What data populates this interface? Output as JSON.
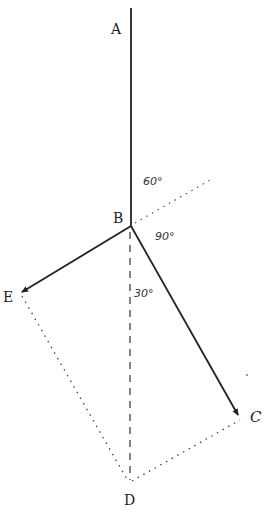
{
  "diagram": {
    "type": "force-vector-parallelogram",
    "points": {
      "A": {
        "label": "A",
        "x": 131,
        "y": 8
      },
      "B": {
        "label": "B",
        "x": 131,
        "y": 226
      },
      "C": {
        "label": "C",
        "x": 240,
        "y": 418
      },
      "D": {
        "label": "D",
        "x": 130,
        "y": 483
      },
      "E": {
        "label": "E",
        "x": 20,
        "y": 293
      }
    },
    "labels": {
      "A": "A",
      "B": "B",
      "C": "C",
      "D": "D",
      "E": "E"
    },
    "angles": {
      "a60": "60°",
      "a90": "90°",
      "a30": "30°"
    },
    "colors": {
      "line": "#222222",
      "dotted": "#444444",
      "background": "#ffffff"
    }
  }
}
